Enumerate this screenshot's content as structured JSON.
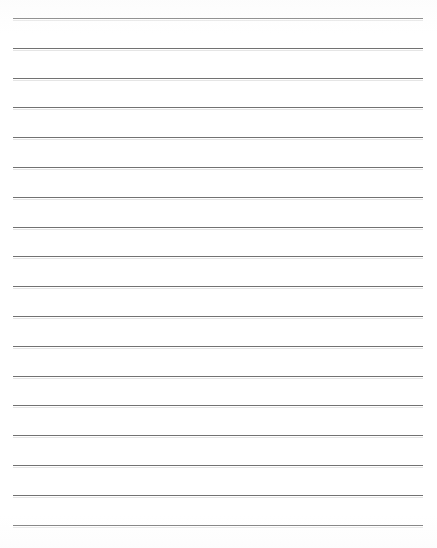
{
  "document": {
    "type": "lined-paper",
    "title": "Blank lined writing paper",
    "page": {
      "width": 437,
      "height": 548,
      "background_color": "#ffffff"
    },
    "ruling": {
      "line_count": 18,
      "line_color": "#5a5a5a",
      "line_thickness_px": 1,
      "first_line_y": 18,
      "line_spacing_px": 29.8,
      "line_start_x": 13,
      "line_end_x": 423,
      "margin_line": false,
      "header_text": "",
      "lines": [
        {
          "index": 1,
          "y": 18,
          "text": ""
        },
        {
          "index": 2,
          "y": 47.8,
          "text": ""
        },
        {
          "index": 3,
          "y": 77.6,
          "text": ""
        },
        {
          "index": 4,
          "y": 107.4,
          "text": ""
        },
        {
          "index": 5,
          "y": 137.2,
          "text": ""
        },
        {
          "index": 6,
          "y": 167.0,
          "text": ""
        },
        {
          "index": 7,
          "y": 196.8,
          "text": ""
        },
        {
          "index": 8,
          "y": 226.6,
          "text": ""
        },
        {
          "index": 9,
          "y": 256.4,
          "text": ""
        },
        {
          "index": 10,
          "y": 286.2,
          "text": ""
        },
        {
          "index": 11,
          "y": 316.0,
          "text": ""
        },
        {
          "index": 12,
          "y": 345.8,
          "text": ""
        },
        {
          "index": 13,
          "y": 375.6,
          "text": ""
        },
        {
          "index": 14,
          "y": 405.4,
          "text": ""
        },
        {
          "index": 15,
          "y": 435.2,
          "text": ""
        },
        {
          "index": 16,
          "y": 465.0,
          "text": ""
        },
        {
          "index": 17,
          "y": 494.8,
          "text": ""
        },
        {
          "index": 18,
          "y": 524.6,
          "text": ""
        }
      ]
    }
  }
}
